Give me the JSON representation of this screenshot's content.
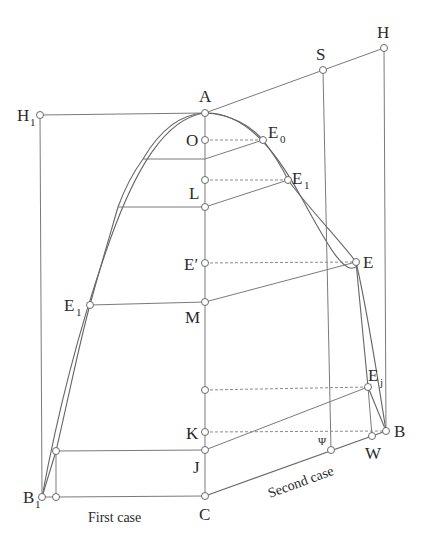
{
  "diagram": {
    "type": "geometric construction",
    "labels": {
      "A": "A",
      "O": "O",
      "E0": "E",
      "E0_sub": "0",
      "E1_right": "E",
      "E1_right_sub": "1",
      "L": "L",
      "E_prime": "E′",
      "E": "E",
      "E1_left": "E",
      "E1_left_sub": "1",
      "M": "M",
      "Ej": "E",
      "Ej_sub": "j",
      "K": "K",
      "J": "J",
      "Psi": "Ψ",
      "W": "W",
      "B": "B",
      "C": "C",
      "B1": "B",
      "B1_sub": "1",
      "H1": "H",
      "H1_sub": "1",
      "H": "H",
      "S": "S"
    },
    "captions": {
      "first_case": "First case",
      "second_case": "Second case"
    },
    "points": {
      "A": [
        205,
        113
      ],
      "O": [
        205,
        140
      ],
      "E0": [
        263,
        140
      ],
      "L_upper": [
        205,
        180
      ],
      "E1_right": [
        288,
        180
      ],
      "L": [
        205,
        207
      ],
      "E_prime": [
        205,
        263
      ],
      "E": [
        356,
        262
      ],
      "M": [
        205,
        302
      ],
      "E1_left": [
        90,
        305
      ],
      "K_upper": [
        205,
        390
      ],
      "Ej": [
        368,
        387
      ],
      "K": [
        205,
        432
      ],
      "J": [
        205,
        450
      ],
      "Psi": [
        331,
        450
      ],
      "W": [
        372,
        436
      ],
      "B": [
        386,
        431
      ],
      "C": [
        205,
        496
      ],
      "B1": [
        42,
        497
      ],
      "B1_right": [
        56,
        497
      ],
      "J_left": [
        56,
        451
      ],
      "H1": [
        40,
        115
      ],
      "H": [
        384,
        48
      ],
      "S": [
        323,
        70
      ]
    }
  }
}
